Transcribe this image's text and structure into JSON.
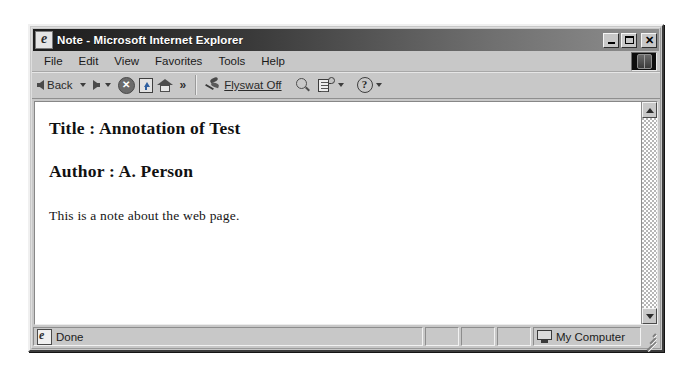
{
  "window": {
    "title": "Note - Microsoft Internet Explorer",
    "title_icon": "ie-document-icon",
    "buttons": {
      "minimize": "minimize-icon",
      "maximize": "maximize-icon",
      "close": "close-icon"
    }
  },
  "menubar": {
    "items": [
      {
        "label": "File"
      },
      {
        "label": "Edit"
      },
      {
        "label": "View"
      },
      {
        "label": "Favorites"
      },
      {
        "label": "Tools"
      },
      {
        "label": "Help"
      }
    ],
    "logo": "internet-explorer-logo"
  },
  "toolbar": {
    "back_label": "Back",
    "forward_label": "",
    "stop_icon": "stop-icon",
    "refresh_icon": "refresh-icon",
    "home_icon": "home-icon",
    "overflow_label": "»",
    "flyswat_icon": "flyswat-icon",
    "flyswat_label": "Flyswat Off",
    "search_icon": "magnifier-icon",
    "notes_icon": "notes-icon",
    "help_icon": "question-mark-icon"
  },
  "page": {
    "title_line": "Title : Annotation of Test",
    "author_line": "Author : A. Person",
    "body_text": "This is a note about the web page."
  },
  "scrollbar": {
    "up_icon": "scroll-up-arrow-icon",
    "down_icon": "scroll-down-arrow-icon"
  },
  "statusbar": {
    "status_text": "Done",
    "status_icon": "ie-document-icon",
    "panel_2": "",
    "panel_3": "",
    "panel_4": "",
    "zone_label": "My Computer",
    "zone_icon": "monitor-icon"
  }
}
